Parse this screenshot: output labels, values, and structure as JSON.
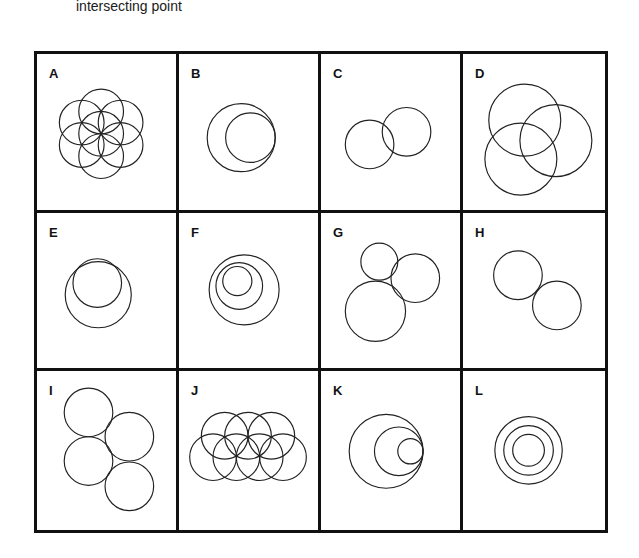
{
  "caption": "intersecting point",
  "panels": [
    {
      "label": "A",
      "description": "seed-of-life: central circle with six surrounding overlapping circles"
    },
    {
      "label": "B",
      "description": "small circle internally tangent inside larger circle (right side)"
    },
    {
      "label": "C",
      "description": "two equal circles partially overlapping"
    },
    {
      "label": "D",
      "description": "three large circles mutually overlapping"
    },
    {
      "label": "E",
      "description": "smaller circle inside larger circle, intersecting near top"
    },
    {
      "label": "F",
      "description": "three nested circles, inner pair offset upward-left"
    },
    {
      "label": "G",
      "description": "three circles of different sizes, mutually tangent"
    },
    {
      "label": "H",
      "description": "two equal circles externally tangent diagonally"
    },
    {
      "label": "I",
      "description": "four equal circles in tangent staggered arrangement"
    },
    {
      "label": "J",
      "description": "seven overlapping circles: row of 3 above row of 4"
    },
    {
      "label": "K",
      "description": "three circles internally tangent at one right-side point"
    },
    {
      "label": "L",
      "description": "three concentric circles"
    }
  ],
  "colors": {
    "stroke": "#222222",
    "border": "#111111",
    "background": "#ffffff"
  }
}
